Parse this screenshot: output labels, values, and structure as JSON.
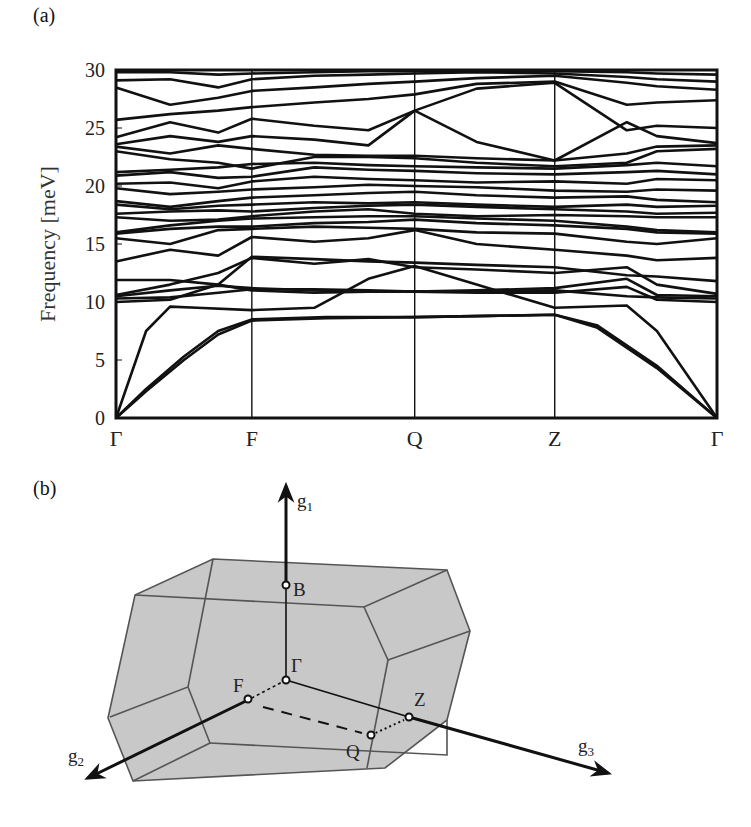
{
  "panels": {
    "a_label": "(a)",
    "b_label": "(b)"
  },
  "chart_data": {
    "type": "line",
    "title": "",
    "xlabel": "",
    "ylabel": "Frequency [meV]",
    "ylim": [
      0,
      30
    ],
    "yticks": [
      0,
      5,
      10,
      15,
      20,
      25,
      30
    ],
    "grid": false,
    "legend": null,
    "kpath": [
      "Γ",
      "F",
      "Q",
      "Z",
      "Γ"
    ],
    "kpath_positions": [
      0,
      0.226,
      0.497,
      0.73,
      1.0
    ],
    "bands_description": "Phonon dispersion; ~36 branches, 3 acoustic branches start at 0 meV at Γ; optical branches 9-30 meV",
    "series": [
      {
        "name": "acoustic-1",
        "x": [
          0,
          0.05,
          0.113,
          0.17,
          0.226,
          0.35,
          0.497,
          0.62,
          0.73,
          0.8,
          0.9,
          1.0
        ],
        "values": [
          0,
          2.5,
          5.3,
          7.5,
          8.5,
          8.7,
          8.7,
          8.8,
          8.9,
          8.0,
          4.5,
          0
        ]
      },
      {
        "name": "acoustic-2",
        "x": [
          0,
          0.05,
          0.113,
          0.17,
          0.226,
          0.35,
          0.497,
          0.62,
          0.73,
          0.8,
          0.9,
          1.0
        ],
        "values": [
          0,
          2.3,
          5.0,
          7.2,
          8.4,
          8.6,
          8.7,
          8.8,
          8.9,
          7.8,
          4.3,
          0
        ]
      },
      {
        "name": "acoustic-3",
        "x": [
          0,
          0.05,
          0.09,
          0.135,
          0.226,
          0.33,
          0.42,
          0.497,
          0.6,
          0.73,
          0.85,
          0.9,
          1.0
        ],
        "values": [
          0,
          7.5,
          9.6,
          9.5,
          9.3,
          9.5,
          12.0,
          13.1,
          11.5,
          9.5,
          9.7,
          7.5,
          0
        ]
      },
      {
        "name": "b4",
        "x": [
          0,
          0.09,
          0.17,
          0.226,
          0.33,
          0.42,
          0.497,
          0.6,
          0.73,
          0.85,
          0.9,
          1.0
        ],
        "values": [
          10.0,
          10.2,
          11.5,
          11.0,
          10.8,
          10.9,
          10.9,
          10.8,
          10.8,
          11.3,
          10.2,
          10.0
        ]
      },
      {
        "name": "b5",
        "x": [
          0,
          0.09,
          0.17,
          0.226,
          0.33,
          0.42,
          0.497,
          0.6,
          0.73,
          0.85,
          0.9,
          1.0
        ],
        "values": [
          10.3,
          10.4,
          10.8,
          11.1,
          11.1,
          11.0,
          10.9,
          10.9,
          11.0,
          10.5,
          10.4,
          10.3
        ]
      },
      {
        "name": "b6",
        "x": [
          0,
          0.09,
          0.17,
          0.226,
          0.33,
          0.42,
          0.497,
          0.6,
          0.73,
          0.85,
          0.9,
          1.0
        ],
        "values": [
          10.5,
          11.0,
          11.4,
          11.2,
          11.0,
          10.9,
          10.9,
          11.0,
          11.2,
          12.0,
          10.6,
          10.5
        ]
      },
      {
        "name": "b7",
        "x": [
          0,
          0.09,
          0.17,
          0.226,
          0.33,
          0.42,
          0.497,
          0.6,
          0.73,
          0.85,
          0.9,
          1.0
        ],
        "values": [
          10.6,
          11.5,
          12.5,
          13.8,
          13.3,
          13.7,
          13.0,
          12.8,
          12.5,
          13.0,
          11.5,
          10.7
        ]
      },
      {
        "name": "b8",
        "x": [
          0,
          0.09,
          0.17,
          0.226,
          0.33,
          0.42,
          0.497,
          0.6,
          0.73,
          0.85,
          0.9,
          1.0
        ],
        "values": [
          11.9,
          11.9,
          11.5,
          13.9,
          13.7,
          13.5,
          13.4,
          13.2,
          13.0,
          12.3,
          12.2,
          11.8
        ]
      },
      {
        "name": "b9",
        "x": [
          0,
          0.09,
          0.17,
          0.226,
          0.33,
          0.42,
          0.497,
          0.6,
          0.73,
          0.85,
          0.9,
          1.0
        ],
        "values": [
          13.5,
          14.5,
          14.0,
          15.6,
          15.2,
          15.5,
          16.2,
          15.0,
          14.5,
          14.0,
          13.6,
          13.8
        ]
      },
      {
        "name": "b10",
        "x": [
          0,
          0.09,
          0.17,
          0.226,
          0.33,
          0.42,
          0.497,
          0.6,
          0.73,
          0.85,
          0.9,
          1.0
        ],
        "values": [
          15.5,
          15.0,
          16.2,
          16.3,
          16.5,
          16.4,
          16.3,
          16.0,
          15.9,
          15.2,
          15.0,
          15.5
        ]
      },
      {
        "name": "b11",
        "x": [
          0,
          0.09,
          0.17,
          0.226,
          0.33,
          0.42,
          0.497,
          0.6,
          0.73,
          0.85,
          0.9,
          1.0
        ],
        "values": [
          15.9,
          16.3,
          16.5,
          16.5,
          16.8,
          16.9,
          17.1,
          16.8,
          16.6,
          16.3,
          16.0,
          15.9
        ]
      },
      {
        "name": "b12",
        "x": [
          0,
          0.09,
          0.17,
          0.226,
          0.33,
          0.42,
          0.497,
          0.6,
          0.73,
          0.85,
          0.9,
          1.0
        ],
        "values": [
          16.0,
          16.6,
          17.0,
          17.2,
          17.3,
          17.4,
          17.4,
          17.2,
          17.0,
          16.5,
          16.2,
          16.0
        ]
      },
      {
        "name": "b13",
        "x": [
          0,
          0.09,
          0.17,
          0.226,
          0.33,
          0.42,
          0.497,
          0.6,
          0.73,
          0.85,
          0.9,
          1.0
        ],
        "values": [
          17.3,
          17.0,
          17.1,
          17.4,
          17.8,
          18.0,
          17.6,
          17.4,
          17.5,
          17.4,
          17.3,
          17.3
        ]
      },
      {
        "name": "b14",
        "x": [
          0,
          0.09,
          0.17,
          0.226,
          0.33,
          0.42,
          0.497,
          0.6,
          0.73,
          0.85,
          0.9,
          1.0
        ],
        "values": [
          17.6,
          17.8,
          17.9,
          17.8,
          18.1,
          18.3,
          18.4,
          18.2,
          18.0,
          17.8,
          17.6,
          17.7
        ]
      },
      {
        "name": "b15",
        "x": [
          0,
          0.09,
          0.17,
          0.226,
          0.33,
          0.42,
          0.497,
          0.6,
          0.73,
          0.85,
          0.9,
          1.0
        ],
        "values": [
          18.4,
          18.0,
          18.3,
          18.4,
          18.6,
          18.5,
          18.6,
          18.4,
          18.2,
          18.4,
          18.2,
          18.3
        ]
      },
      {
        "name": "b16",
        "x": [
          0,
          0.09,
          0.17,
          0.226,
          0.33,
          0.42,
          0.497,
          0.6,
          0.73,
          0.85,
          0.9,
          1.0
        ],
        "values": [
          18.7,
          18.2,
          18.7,
          19.0,
          19.2,
          19.4,
          19.5,
          19.2,
          19.0,
          19.1,
          18.8,
          18.6
        ]
      },
      {
        "name": "b17",
        "x": [
          0,
          0.09,
          0.17,
          0.226,
          0.33,
          0.42,
          0.497,
          0.6,
          0.73,
          0.85,
          0.9,
          1.0
        ],
        "values": [
          19.8,
          19.3,
          19.5,
          19.7,
          19.9,
          20.1,
          20.0,
          19.9,
          19.6,
          19.5,
          19.7,
          19.6
        ]
      },
      {
        "name": "b18",
        "x": [
          0,
          0.09,
          0.17,
          0.226,
          0.33,
          0.42,
          0.497,
          0.6,
          0.73,
          0.85,
          0.9,
          1.0
        ],
        "values": [
          20.2,
          20.3,
          19.8,
          20.4,
          20.8,
          20.6,
          20.5,
          20.3,
          20.4,
          20.2,
          20.6,
          20.5
        ]
      },
      {
        "name": "b19",
        "x": [
          0,
          0.09,
          0.17,
          0.226,
          0.33,
          0.42,
          0.497,
          0.6,
          0.73,
          0.85,
          0.9,
          1.0
        ],
        "values": [
          20.9,
          21.2,
          20.7,
          20.8,
          21.6,
          21.4,
          21.3,
          21.1,
          21.0,
          21.2,
          21.3,
          21.0
        ]
      },
      {
        "name": "b20",
        "x": [
          0,
          0.09,
          0.17,
          0.226,
          0.33,
          0.42,
          0.497,
          0.6,
          0.73,
          0.85,
          0.9,
          1.0
        ],
        "values": [
          21.2,
          21.4,
          21.6,
          21.9,
          22.0,
          21.8,
          21.7,
          21.6,
          21.5,
          21.8,
          22.0,
          21.7
        ]
      },
      {
        "name": "b21",
        "x": [
          0,
          0.09,
          0.17,
          0.226,
          0.33,
          0.42,
          0.497,
          0.6,
          0.73,
          0.85,
          0.9,
          1.0
        ],
        "values": [
          23.0,
          22.3,
          22.0,
          21.5,
          22.5,
          22.5,
          22.4,
          22.0,
          21.7,
          22.0,
          23.0,
          23.2
        ]
      },
      {
        "name": "b22",
        "x": [
          0,
          0.09,
          0.17,
          0.226,
          0.33,
          0.42,
          0.497,
          0.6,
          0.73,
          0.85,
          0.9,
          1.0
        ],
        "values": [
          23.4,
          22.8,
          23.5,
          23.2,
          22.7,
          22.6,
          22.6,
          22.4,
          22.2,
          22.8,
          23.4,
          23.5
        ]
      },
      {
        "name": "b23",
        "x": [
          0,
          0.09,
          0.17,
          0.226,
          0.33,
          0.42,
          0.497,
          0.6,
          0.73,
          0.85,
          0.9,
          1.0
        ],
        "values": [
          23.6,
          24.3,
          23.8,
          24.3,
          24.0,
          23.5,
          26.5,
          23.8,
          22.2,
          25.5,
          24.3,
          23.7
        ]
      },
      {
        "name": "b24",
        "x": [
          0,
          0.09,
          0.17,
          0.226,
          0.33,
          0.42,
          0.497,
          0.6,
          0.73,
          0.85,
          0.9,
          1.0
        ],
        "values": [
          24.2,
          25.5,
          24.6,
          25.8,
          25.2,
          24.8,
          26.5,
          28.4,
          28.9,
          24.8,
          25.2,
          25.0
        ]
      },
      {
        "name": "b25",
        "x": [
          0,
          0.09,
          0.17,
          0.226,
          0.33,
          0.42,
          0.497,
          0.6,
          0.73,
          0.85,
          0.9,
          1.0
        ],
        "values": [
          25.7,
          26.2,
          26.5,
          26.8,
          27.2,
          27.5,
          27.9,
          28.8,
          29.0,
          27.0,
          27.2,
          27.4
        ]
      },
      {
        "name": "b26",
        "x": [
          0,
          0.09,
          0.17,
          0.226,
          0.33,
          0.42,
          0.497,
          0.6,
          0.73,
          0.85,
          0.9,
          1.0
        ],
        "values": [
          28.5,
          27.0,
          27.6,
          28.2,
          28.5,
          28.8,
          29.0,
          29.3,
          29.5,
          28.9,
          28.6,
          28.3
        ]
      },
      {
        "name": "b27",
        "x": [
          0,
          0.09,
          0.17,
          0.226,
          0.33,
          0.42,
          0.497,
          0.6,
          0.73,
          0.85,
          0.9,
          1.0
        ],
        "values": [
          29.1,
          29.2,
          28.5,
          29.2,
          29.5,
          29.6,
          29.7,
          29.8,
          29.7,
          29.4,
          29.2,
          29.0
        ]
      },
      {
        "name": "b28",
        "x": [
          0,
          0.09,
          0.17,
          0.226,
          0.33,
          0.42,
          0.497,
          0.6,
          0.73,
          0.85,
          0.9,
          1.0
        ],
        "values": [
          29.8,
          29.8,
          29.6,
          29.7,
          29.8,
          29.9,
          29.9,
          29.9,
          29.9,
          29.8,
          29.7,
          29.6
        ]
      }
    ]
  },
  "diagram": {
    "axes": [
      "g1",
      "g2",
      "g3"
    ],
    "axis_labels": {
      "g1": "g",
      "g1_sub": "1",
      "g2": "g",
      "g2_sub": "2",
      "g3": "g",
      "g3_sub": "3"
    },
    "points": {
      "B": "B",
      "Gamma": "Γ",
      "F": "F",
      "Q": "Q",
      "Z": "Z"
    },
    "face_color": "#c9c9c9",
    "edge_color": "#555555"
  }
}
